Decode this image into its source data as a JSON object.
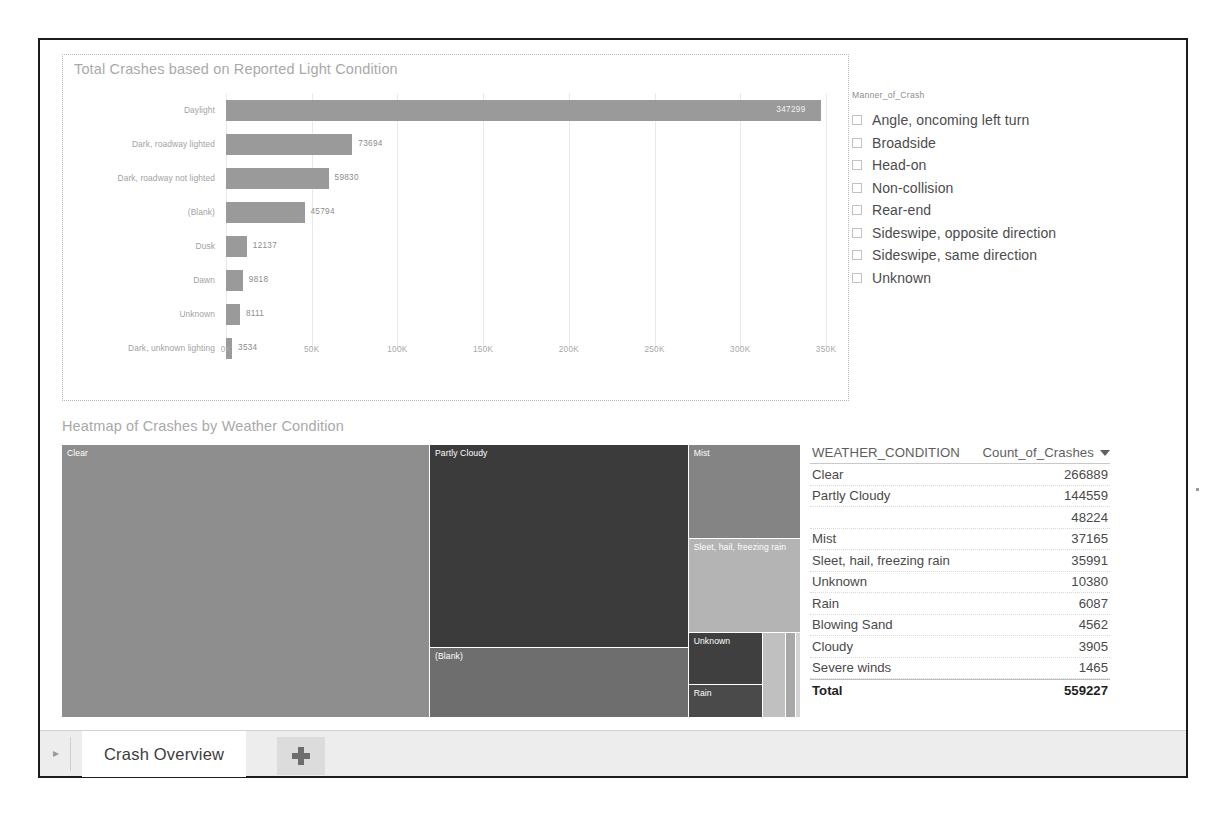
{
  "bar_panel": {
    "title": "Total Crashes based on Reported Light Condition"
  },
  "slicer": {
    "header": "Manner_of_Crash",
    "items": [
      {
        "label": "Angle, oncoming left turn",
        "checked": false
      },
      {
        "label": "Broadside",
        "checked": false
      },
      {
        "label": "Head-on",
        "checked": false
      },
      {
        "label": "Non-collision",
        "checked": false
      },
      {
        "label": "Rear-end",
        "checked": false
      },
      {
        "label": "Sideswipe, opposite direction",
        "checked": false
      },
      {
        "label": "Sideswipe, same direction",
        "checked": false
      },
      {
        "label": "Unknown",
        "checked": false
      }
    ]
  },
  "treemap_panel": {
    "title": "Heatmap of Crashes by Weather Condition",
    "tiles": [
      {
        "label": "Clear",
        "color": "#8e8e8e"
      },
      {
        "label": "Partly Cloudy",
        "color": "#3b3b3b"
      },
      {
        "label": "(Blank)",
        "color": "#6e6e6e"
      },
      {
        "label": "Mist",
        "color": "#848484"
      },
      {
        "label": "Sleet, hail, freezing rain",
        "color": "#b4b4b4"
      },
      {
        "label": "Unknown",
        "color": "#3f3f3f"
      },
      {
        "label": "Rain",
        "color": "#4a4a4a"
      },
      {
        "label": "",
        "color": "#c0c0c0"
      },
      {
        "label": "",
        "color": "#a8a8a8"
      },
      {
        "label": "",
        "color": "#d2d2d2"
      }
    ]
  },
  "table": {
    "headers": {
      "condition": "WEATHER_CONDITION",
      "count": "Count_of_Crashes"
    },
    "rows": [
      {
        "label": "Clear",
        "value": "266889"
      },
      {
        "label": "Partly Cloudy",
        "value": "144559"
      },
      {
        "label": "",
        "value": "48224"
      },
      {
        "label": "Mist",
        "value": "37165"
      },
      {
        "label": "Sleet, hail, freezing rain",
        "value": "35991"
      },
      {
        "label": "Unknown",
        "value": "10380"
      },
      {
        "label": "Rain",
        "value": "6087"
      },
      {
        "label": "Blowing Sand",
        "value": "4562"
      },
      {
        "label": "Cloudy",
        "value": "3905"
      },
      {
        "label": "Severe winds",
        "value": "1465"
      }
    ],
    "total": {
      "label": "Total",
      "value": "559227"
    }
  },
  "tabbar": {
    "nav_arrow": "▸",
    "active_tab": "Crash Overview",
    "add_tab_label": "+"
  },
  "chart_data": {
    "type": "bar",
    "title": "Total Crashes based on Reported Light Condition",
    "orientation": "horizontal",
    "xlabel": "",
    "ylabel": "",
    "xlim": [
      0,
      350000
    ],
    "grid": true,
    "tick_labels": [
      "0K",
      "50K",
      "100K",
      "150K",
      "200K",
      "250K",
      "300K",
      "350K"
    ],
    "tick_values": [
      0,
      50000,
      100000,
      150000,
      200000,
      250000,
      300000,
      350000
    ],
    "categories": [
      "Daylight",
      "Dark, roadway lighted",
      "Dark, roadway not lighted",
      "(Blank)",
      "Dusk",
      "Dawn",
      "Unknown",
      "Dark, unknown lighting"
    ],
    "values": [
      347299,
      73694,
      59830,
      45794,
      12137,
      9818,
      8111,
      3534
    ],
    "value_labels": [
      "347299",
      "73694",
      "59830",
      "45794",
      "12137",
      "9818",
      "8111",
      "3534"
    ],
    "bar_color": "#9a9a9a"
  },
  "treemap_data": {
    "type": "treemap",
    "title": "Heatmap of Crashes by Weather Condition",
    "categories": [
      "Clear",
      "Partly Cloudy",
      "(Blank)",
      "Mist",
      "Sleet, hail, freezing rain",
      "Unknown",
      "Rain",
      "Blowing Sand",
      "Cloudy",
      "Severe winds"
    ],
    "values": [
      266889,
      144559,
      48224,
      37165,
      35991,
      10380,
      6087,
      4562,
      3905,
      1465
    ]
  }
}
